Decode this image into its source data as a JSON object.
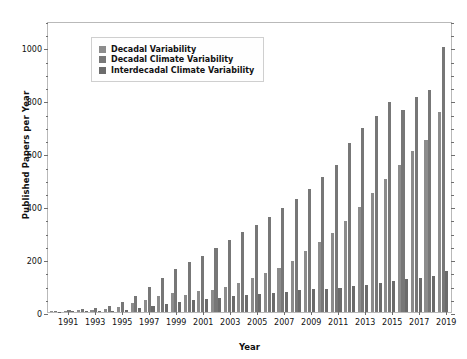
{
  "chart_data": {
    "type": "bar",
    "title": "",
    "xlabel": "Year",
    "ylabel": "Published Papers per Year",
    "ylim": [
      0,
      1100
    ],
    "ytick_major": [
      0,
      200,
      400,
      600,
      800,
      1000
    ],
    "ytick_minor_step": 50,
    "grid": false,
    "legend_position": "upper left",
    "categories": [
      1990,
      1991,
      1992,
      1993,
      1994,
      1995,
      1996,
      1997,
      1998,
      1999,
      2000,
      2001,
      2002,
      2003,
      2004,
      2005,
      2006,
      2007,
      2008,
      2009,
      2010,
      2011,
      2012,
      2013,
      2014,
      2015,
      2016,
      2017,
      2018,
      2019
    ],
    "xtick_labels": [
      "1991",
      "1993",
      "1995",
      "1997",
      "1999",
      "2001",
      "2003",
      "2005",
      "2007",
      "2009",
      "2011",
      "2013",
      "2015",
      "2017",
      "2019"
    ],
    "series": [
      {
        "name": "Decadal Variability",
        "color": "#8c8c8c",
        "values": [
          3,
          5,
          6,
          9,
          12,
          20,
          34,
          47,
          60,
          73,
          66,
          79,
          84,
          96,
          110,
          128,
          148,
          168,
          196,
          232,
          268,
          300,
          345,
          400,
          452,
          508,
          560,
          612,
          655,
          760
        ]
      },
      {
        "name": "Decadal Climate Variability",
        "color": "#777777",
        "values": [
          5,
          8,
          11,
          16,
          24,
          40,
          62,
          95,
          130,
          165,
          190,
          215,
          245,
          275,
          305,
          330,
          360,
          395,
          430,
          470,
          515,
          560,
          645,
          700,
          745,
          800,
          770,
          820,
          845,
          1010
        ]
      },
      {
        "name": "Interdecadal Climate Variability",
        "color": "#6b6b6b",
        "values": [
          1,
          2,
          2,
          3,
          5,
          8,
          14,
          22,
          30,
          38,
          44,
          50,
          55,
          60,
          66,
          70,
          74,
          78,
          82,
          86,
          88,
          92,
          98,
          104,
          110,
          118,
          124,
          130,
          136,
          155
        ]
      }
    ]
  },
  "legend": {
    "items": [
      {
        "label": "Decadal Variability"
      },
      {
        "label": "Decadal Climate Variability"
      },
      {
        "label": "Interdecadal Climate Variability"
      }
    ]
  }
}
